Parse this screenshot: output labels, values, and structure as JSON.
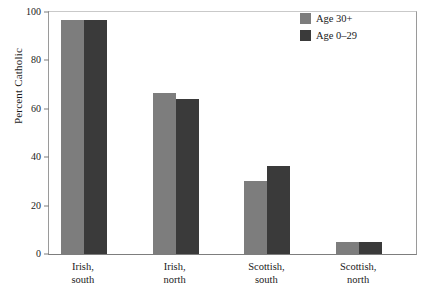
{
  "chart_data": {
    "type": "bar",
    "title": "",
    "subtitle": "",
    "xlabel": "",
    "ylabel": "Percent Catholic",
    "ylim": [
      0,
      100
    ],
    "yticks": [
      0,
      20,
      40,
      60,
      80,
      100
    ],
    "ytick_labels": [
      "0",
      "20",
      "40",
      "60",
      "80",
      "100"
    ],
    "grid": false,
    "legend_position": "top-right-inside",
    "categories": [
      "Irish, south",
      "Irish, north",
      "Scottish, south",
      "Scottish, north"
    ],
    "category_lines": [
      [
        "Irish,",
        "south"
      ],
      [
        "Irish,",
        "north"
      ],
      [
        "Scottish,",
        "south"
      ],
      [
        "Scottish,",
        "north"
      ]
    ],
    "series": [
      {
        "name": "Age 30+",
        "color": "#7d7d7d",
        "values": [
          96.5,
          66.5,
          30.0,
          5.0
        ]
      },
      {
        "name": "Age 0–29",
        "color": "#3a3a3a",
        "values": [
          96.5,
          64.0,
          36.5,
          5.0
        ]
      }
    ]
  },
  "axes": {
    "y_title": "Percent Catholic"
  },
  "colors": {
    "series_light": "#7d7d7d",
    "series_dark": "#3a3a3a",
    "frame": "#9a9a9a",
    "baseline": "#7d7d7d",
    "text": "#1a1a1a",
    "background": "#ffffff"
  }
}
